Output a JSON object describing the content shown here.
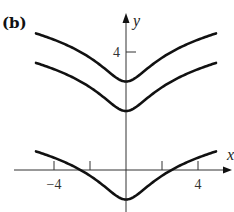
{
  "panel_label": "(b)",
  "colors": {
    "curve": "#111111",
    "axis": "#333333",
    "background": "#ffffff"
  },
  "chart_data": {
    "type": "line",
    "title": "",
    "xlabel": "x",
    "ylabel": "y",
    "xlim": [
      -5,
      5
    ],
    "ylim": [
      -1.2,
      5.3
    ],
    "grid": false,
    "legend": null,
    "x_ticks": [
      -4,
      -2,
      2,
      4
    ],
    "x_tick_labels": [
      {
        "value": -4,
        "label": "−4"
      },
      {
        "value": 4,
        "label": "4"
      }
    ],
    "y_ticks": [
      4
    ],
    "y_tick_labels": [
      {
        "value": 4,
        "label": "4"
      }
    ],
    "series": [
      {
        "name": "C = 3",
        "C": 3,
        "x": [
          -5,
          -4,
          -3,
          -2,
          -1,
          0,
          1,
          2,
          3,
          4,
          5
        ],
        "values": [
          4.63,
          4.42,
          4.15,
          3.8,
          3.35,
          3.0,
          3.35,
          3.8,
          4.15,
          4.42,
          4.63
        ]
      },
      {
        "name": "C = 2",
        "C": 2,
        "x": [
          -5,
          -4,
          -3,
          -2,
          -1,
          0,
          1,
          2,
          3,
          4,
          5
        ],
        "values": [
          3.63,
          3.42,
          3.15,
          2.8,
          2.35,
          2.0,
          2.35,
          2.8,
          3.15,
          3.42,
          3.63
        ]
      },
      {
        "name": "C = -1",
        "C": -1,
        "x": [
          -5,
          -4,
          -3,
          -2,
          -1,
          0,
          1,
          2,
          3,
          4,
          5
        ],
        "values": [
          0.63,
          0.42,
          0.15,
          -0.2,
          -0.65,
          -1.0,
          -0.65,
          -0.2,
          0.15,
          0.42,
          0.63
        ]
      }
    ]
  },
  "layout": {
    "origin_px": [
      126,
      170
    ],
    "x_scale_px": 18,
    "y_scale_px": 29.5,
    "x_axis_px": [
      14,
      232
    ],
    "y_axis_px": [
      212,
      13
    ]
  }
}
